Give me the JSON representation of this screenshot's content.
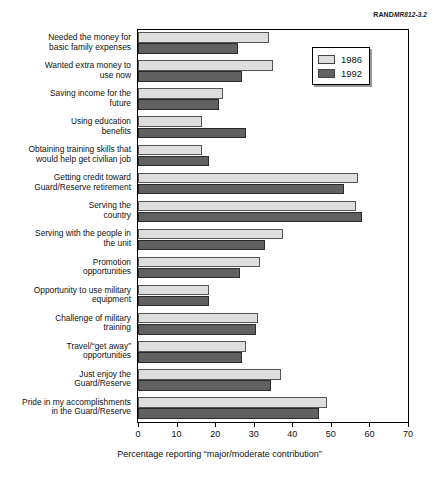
{
  "source_label": {
    "prefix": "RAND",
    "code": "MR812-3.2"
  },
  "legend": {
    "position": "top-right",
    "entries": [
      {
        "label": "1986",
        "color": "#dedede"
      },
      {
        "label": "1992",
        "color": "#616161"
      }
    ]
  },
  "chart_data": {
    "type": "bar",
    "orientation": "horizontal",
    "title": "",
    "subtitle": "",
    "xlabel": "Percentage reporting “major/moderate contribution”",
    "ylabel": "",
    "xlim": [
      0,
      70
    ],
    "xticks": [
      0,
      10,
      20,
      30,
      40,
      50,
      60,
      70
    ],
    "xtick_labels": [
      "0",
      "10",
      "20",
      "30",
      "40",
      "50",
      "60",
      "70"
    ],
    "grid": false,
    "legend_position": "upper right",
    "categories": [
      "Needed the money for basic family expenses",
      "Wanted extra money to use now",
      "Saving income for the future",
      "Using education benefits",
      "Obtaining training skills that would help get civilian job",
      "Getting credit toward Guard/Reserve retirement",
      "Serving the country",
      "Serving with the people in the unit",
      "Promotion opportunities",
      "Opportunity to use military equipment",
      "Challenge of military training",
      "Travel/“get away” opportunities",
      "Just enjoy the Guard/Reserve",
      "Pride in my accomplishments in the Guard/Reserve"
    ],
    "category_lines": [
      [
        "Needed the money for",
        "basic family expenses"
      ],
      [
        "Wanted extra money to",
        "use now"
      ],
      [
        "Saving income for the",
        "future"
      ],
      [
        "Using education",
        "benefits"
      ],
      [
        "Obtaining training skills that",
        "would help get civilian job"
      ],
      [
        "Getting credit toward",
        "Guard/Reserve retirement"
      ],
      [
        "Serving the",
        "country"
      ],
      [
        "Serving with the people in",
        "the unit"
      ],
      [
        "Promotion",
        "opportunities"
      ],
      [
        "Opportunity to use military",
        "equipment"
      ],
      [
        "Challenge of military",
        "training"
      ],
      [
        "Travel/“get away”",
        "opportunities"
      ],
      [
        "Just enjoy the",
        "Guard/Reserve"
      ],
      [
        "Pride in my accomplishments",
        "in the Guard/Reserve"
      ]
    ],
    "series": [
      {
        "name": "1986",
        "color": "#dedede",
        "values": [
          34,
          35,
          22,
          16.5,
          16.5,
          57,
          56.5,
          37.5,
          31.5,
          18.5,
          31,
          28,
          37,
          49
        ]
      },
      {
        "name": "1992",
        "color": "#616161",
        "values": [
          26,
          27,
          21,
          28,
          18.5,
          53.5,
          58,
          33,
          26.5,
          18.5,
          30.5,
          27,
          34.5,
          47
        ]
      }
    ]
  }
}
